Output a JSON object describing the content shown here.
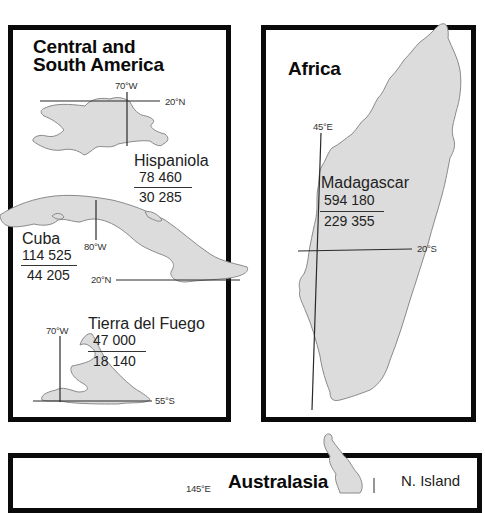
{
  "colors": {
    "land": "#dcdcdc",
    "coast": "#8a8a8a",
    "grid": "#2a2a2a",
    "border": "#0a0a0a"
  },
  "panels": {
    "central_south_america": {
      "title_line1": "Central and",
      "title_line2": "South America",
      "islands": [
        {
          "name": "Hispaniola",
          "area_km2": "78 460",
          "area_sq_mi": "30 285",
          "lon_label": "70°W",
          "lat_label": "20°N"
        },
        {
          "name": "Cuba",
          "area_km2": "114 525",
          "area_sq_mi": "44 205",
          "lon_label": "80°W",
          "lat_label": "20°N"
        },
        {
          "name": "Tierra del Fuego",
          "area_km2": "47 000",
          "area_sq_mi": "18 140",
          "lon_label": "70°W",
          "lat_label": "55°S"
        }
      ]
    },
    "africa": {
      "title": "Africa",
      "islands": [
        {
          "name": "Madagascar",
          "area_km2": "594 180",
          "area_sq_mi": "229 355",
          "lon_label": "45°E",
          "lat_label": "20°S"
        }
      ]
    },
    "australasia": {
      "title": "Australasia",
      "lon_label": "145°E",
      "islands": [
        {
          "name": "N. Island"
        }
      ]
    }
  }
}
